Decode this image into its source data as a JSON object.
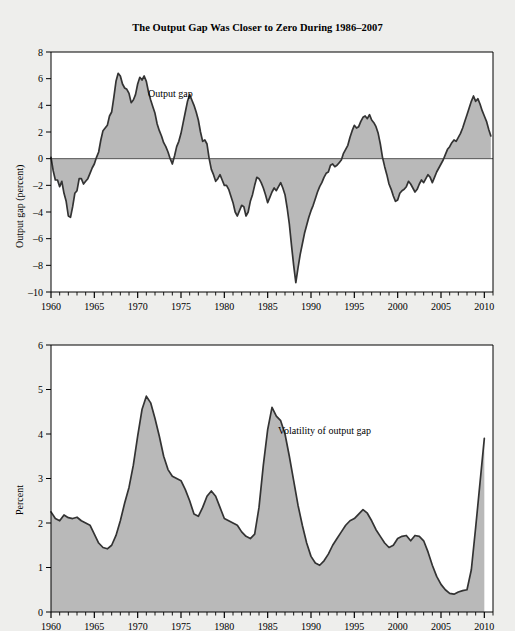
{
  "figure": {
    "title": "The Output Gap Was Closer to Zero During 1986–2007",
    "background_color": "#eeeeec",
    "plot_background_color": "#ffffff",
    "fill_color": "#b9b9b9",
    "line_color": "#333333",
    "axis_color": "#000000"
  },
  "chart_data": [
    {
      "type": "area",
      "id": "output-gap",
      "title": "The Output Gap Was Closer to Zero During 1986–2007",
      "xlabel": "",
      "ylabel": "Output gap (percent)",
      "annotation": "Output gap",
      "annotation_x": 1971.2,
      "annotation_y": 4.6,
      "xlim": [
        1960,
        2011
      ],
      "ylim": [
        -10,
        8
      ],
      "yticks": [
        -10,
        -8,
        -6,
        -4,
        -2,
        0,
        2,
        4,
        6,
        8
      ],
      "ytick_labels": [
        "–10",
        "–8",
        "–6",
        "–4",
        "–2",
        "0",
        "2",
        "4",
        "6",
        "8"
      ],
      "xticks": [
        1960,
        1965,
        1970,
        1975,
        1980,
        1985,
        1990,
        1995,
        2000,
        2005,
        2010
      ],
      "xtick_labels": [
        "1960",
        "1965",
        "1970",
        "1975",
        "1980",
        "1985",
        "1990",
        "1995",
        "2000",
        "2005",
        "2010"
      ],
      "minor_xtick_interval": 1,
      "grid": false,
      "baseline": 0,
      "fill_to": 0,
      "x": [
        1960.0,
        1960.25,
        1960.5,
        1960.75,
        1961.0,
        1961.25,
        1961.5,
        1961.75,
        1962.0,
        1962.25,
        1962.5,
        1962.75,
        1963.0,
        1963.25,
        1963.5,
        1963.75,
        1964.0,
        1964.25,
        1964.5,
        1964.75,
        1965.0,
        1965.25,
        1965.5,
        1965.75,
        1966.0,
        1966.25,
        1966.5,
        1966.75,
        1967.0,
        1967.25,
        1967.5,
        1967.75,
        1968.0,
        1968.25,
        1968.5,
        1968.75,
        1969.0,
        1969.25,
        1969.5,
        1969.75,
        1970.0,
        1970.25,
        1970.5,
        1970.75,
        1971.0,
        1971.25,
        1971.5,
        1971.75,
        1972.0,
        1972.25,
        1972.5,
        1972.75,
        1973.0,
        1973.25,
        1973.5,
        1973.75,
        1974.0,
        1974.25,
        1974.5,
        1974.75,
        1975.0,
        1975.25,
        1975.5,
        1975.75,
        1976.0,
        1976.25,
        1976.5,
        1976.75,
        1977.0,
        1977.25,
        1977.5,
        1977.75,
        1978.0,
        1978.25,
        1978.5,
        1978.75,
        1979.0,
        1979.25,
        1979.5,
        1979.75,
        1980.0,
        1980.25,
        1980.5,
        1980.75,
        1981.0,
        1981.25,
        1981.5,
        1981.75,
        1982.0,
        1982.25,
        1982.5,
        1982.75,
        1983.0,
        1983.25,
        1983.5,
        1983.75,
        1984.0,
        1984.25,
        1984.5,
        1984.75,
        1985.0,
        1985.25,
        1985.5,
        1985.75,
        1986.0,
        1986.25,
        1986.5,
        1986.75,
        1987.0,
        1987.25,
        1987.5,
        1987.75,
        1988.0,
        1988.25,
        1988.5,
        1988.75,
        1989.0,
        1989.25,
        1989.5,
        1989.75,
        1990.0,
        1990.25,
        1990.5,
        1990.75,
        1991.0,
        1991.25,
        1991.5,
        1991.75,
        1992.0,
        1992.25,
        1992.5,
        1992.75,
        1993.0,
        1993.25,
        1993.5,
        1993.75,
        1994.0,
        1994.25,
        1994.5,
        1994.75,
        1995.0,
        1995.25,
        1995.5,
        1995.75,
        1996.0,
        1996.25,
        1996.5,
        1996.75,
        1997.0,
        1997.25,
        1997.5,
        1997.75,
        1998.0,
        1998.25,
        1998.5,
        1998.75,
        1999.0,
        1999.25,
        1999.5,
        1999.75,
        2000.0,
        2000.25,
        2000.5,
        2000.75,
        2001.0,
        2001.25,
        2001.5,
        2001.75,
        2002.0,
        2002.25,
        2002.5,
        2002.75,
        2003.0,
        2003.25,
        2003.5,
        2003.75,
        2004.0,
        2004.25,
        2004.5,
        2004.75,
        2005.0,
        2005.25,
        2005.5,
        2005.75,
        2006.0,
        2006.25,
        2006.5,
        2006.75,
        2007.0,
        2007.25,
        2007.5,
        2007.75,
        2008.0,
        2008.25,
        2008.5,
        2008.75,
        2009.0,
        2009.25,
        2009.5,
        2009.75,
        2010.0,
        2010.25,
        2010.5,
        2010.75
      ],
      "y": [
        0.1,
        -0.9,
        -1.6,
        -1.6,
        -2.1,
        -1.7,
        -2.6,
        -3.2,
        -4.3,
        -4.4,
        -3.6,
        -2.6,
        -2.4,
        -1.5,
        -1.5,
        -1.9,
        -1.7,
        -1.5,
        -1.1,
        -0.7,
        -0.4,
        0.1,
        0.5,
        1.4,
        2.1,
        2.3,
        2.5,
        3.2,
        3.5,
        4.6,
        5.8,
        6.4,
        6.2,
        5.6,
        5.3,
        5.2,
        4.9,
        4.2,
        4.4,
        4.8,
        5.6,
        6.1,
        5.9,
        6.2,
        5.8,
        5.0,
        4.4,
        3.9,
        3.4,
        2.6,
        2.1,
        1.7,
        1.2,
        0.9,
        0.5,
        0.0,
        -0.4,
        0.2,
        0.9,
        1.3,
        1.9,
        2.7,
        3.5,
        4.3,
        4.8,
        4.4,
        4.0,
        3.5,
        2.9,
        2.0,
        1.3,
        1.4,
        1.1,
        0.0,
        -0.8,
        -1.2,
        -1.7,
        -1.5,
        -1.2,
        -1.6,
        -2.0,
        -2.0,
        -2.3,
        -2.8,
        -3.3,
        -4.0,
        -4.3,
        -3.9,
        -3.5,
        -3.6,
        -4.3,
        -4.0,
        -3.2,
        -2.7,
        -2.0,
        -1.4,
        -1.5,
        -1.8,
        -2.2,
        -2.7,
        -3.3,
        -2.9,
        -2.5,
        -2.2,
        -2.4,
        -2.1,
        -1.8,
        -2.2,
        -2.7,
        -3.7,
        -4.9,
        -6.5,
        -8.0,
        -9.3,
        -8.2,
        -7.2,
        -6.4,
        -5.6,
        -5.0,
        -4.4,
        -3.9,
        -3.5,
        -3.0,
        -2.5,
        -2.1,
        -1.8,
        -1.4,
        -1.1,
        -1.0,
        -0.5,
        -0.4,
        -0.6,
        -0.5,
        -0.3,
        -0.1,
        0.4,
        0.7,
        1.0,
        1.6,
        2.1,
        2.5,
        2.3,
        2.4,
        2.8,
        3.1,
        3.2,
        3.0,
        3.3,
        2.9,
        2.7,
        2.4,
        1.9,
        1.1,
        0.1,
        -0.6,
        -1.2,
        -1.9,
        -2.3,
        -2.8,
        -3.2,
        -3.1,
        -2.6,
        -2.4,
        -2.3,
        -2.1,
        -1.7,
        -1.9,
        -2.2,
        -2.5,
        -2.3,
        -1.9,
        -1.6,
        -1.8,
        -1.5,
        -1.2,
        -1.4,
        -1.8,
        -1.4,
        -1.0,
        -0.7,
        -0.4,
        -0.1,
        0.3,
        0.7,
        0.9,
        1.2,
        1.4,
        1.3,
        1.6,
        1.9,
        2.3,
        2.8,
        3.3,
        3.8,
        4.3,
        4.7,
        4.3,
        4.5,
        4.1,
        3.6,
        3.2,
        2.8,
        2.2,
        1.7,
        1.0,
        0.4,
        0.0,
        -0.3,
        -0.6,
        -1.0,
        -1.5,
        -0.9,
        -0.3,
        -0.1,
        -0.2,
        -0.1,
        0.2,
        0.4,
        0.3,
        0.0,
        0.5,
        0.9,
        0.6,
        0.3,
        0.4,
        0.2,
        -0.1,
        -0.4,
        -0.6,
        -1.1,
        -2.0,
        -3.4,
        -5.2,
        -6.9,
        -8.0,
        -8.6,
        -8.3,
        -8.0,
        -8.2,
        -8.0,
        -7.9,
        -7.7
      ]
    },
    {
      "type": "area",
      "id": "volatility-of-output-gap",
      "title": "",
      "xlabel": "",
      "ylabel": "Percent",
      "annotation": "Volatility of output gap",
      "annotation_x": 1986.2,
      "annotation_y": 4.0,
      "xlim": [
        1960,
        2011
      ],
      "ylim": [
        0,
        6
      ],
      "yticks": [
        0,
        1,
        2,
        3,
        4,
        5,
        6
      ],
      "ytick_labels": [
        "0",
        "1",
        "2",
        "3",
        "4",
        "5",
        "6"
      ],
      "xticks": [
        1960,
        1965,
        1970,
        1975,
        1980,
        1985,
        1990,
        1995,
        2000,
        2005,
        2010
      ],
      "xtick_labels": [
        "1960",
        "1965",
        "1970",
        "1975",
        "1980",
        "1985",
        "1990",
        "1995",
        "2000",
        "2005",
        "2010"
      ],
      "minor_xtick_interval": 1,
      "grid": false,
      "baseline": 0,
      "fill_to": 0,
      "x": [
        1960.0,
        1960.5,
        1961.0,
        1961.5,
        1962.0,
        1962.5,
        1963.0,
        1963.5,
        1964.0,
        1964.5,
        1965.0,
        1965.5,
        1966.0,
        1966.5,
        1967.0,
        1967.5,
        1968.0,
        1968.5,
        1969.0,
        1969.5,
        1970.0,
        1970.5,
        1971.0,
        1971.5,
        1972.0,
        1972.5,
        1973.0,
        1973.5,
        1974.0,
        1974.5,
        1975.0,
        1975.5,
        1976.0,
        1976.5,
        1977.0,
        1977.5,
        1978.0,
        1978.5,
        1979.0,
        1979.5,
        1980.0,
        1980.5,
        1981.0,
        1981.5,
        1982.0,
        1982.5,
        1983.0,
        1983.5,
        1984.0,
        1984.5,
        1985.0,
        1985.5,
        1986.0,
        1986.5,
        1987.0,
        1987.5,
        1988.0,
        1988.5,
        1989.0,
        1989.5,
        1990.0,
        1990.5,
        1991.0,
        1991.5,
        1992.0,
        1992.5,
        1993.0,
        1993.5,
        1994.0,
        1994.5,
        1995.0,
        1995.5,
        1996.0,
        1996.5,
        1997.0,
        1997.5,
        1998.0,
        1998.5,
        1999.0,
        1999.5,
        2000.0,
        2000.5,
        2001.0,
        2001.5,
        2002.0,
        2002.5,
        2003.0,
        2003.5,
        2004.0,
        2004.5,
        2005.0,
        2005.5,
        2006.0,
        2006.5,
        2007.0,
        2007.5,
        2008.0,
        2008.5,
        2009.0,
        2009.5,
        2010.0
      ],
      "y": [
        2.25,
        2.1,
        2.05,
        2.18,
        2.12,
        2.1,
        2.13,
        2.05,
        2.0,
        1.95,
        1.75,
        1.55,
        1.45,
        1.42,
        1.5,
        1.72,
        2.05,
        2.45,
        2.8,
        3.3,
        3.95,
        4.55,
        4.85,
        4.7,
        4.35,
        3.95,
        3.5,
        3.2,
        3.05,
        3.0,
        2.95,
        2.75,
        2.5,
        2.2,
        2.15,
        2.35,
        2.6,
        2.72,
        2.6,
        2.35,
        2.1,
        2.05,
        2.0,
        1.95,
        1.8,
        1.7,
        1.65,
        1.75,
        2.35,
        3.3,
        4.1,
        4.6,
        4.4,
        4.3,
        4.0,
        3.5,
        2.95,
        2.4,
        1.95,
        1.55,
        1.25,
        1.1,
        1.05,
        1.15,
        1.3,
        1.5,
        1.65,
        1.8,
        1.95,
        2.05,
        2.1,
        2.2,
        2.3,
        2.22,
        2.05,
        1.85,
        1.7,
        1.55,
        1.45,
        1.5,
        1.65,
        1.7,
        1.72,
        1.6,
        1.72,
        1.7,
        1.6,
        1.35,
        1.05,
        0.8,
        0.62,
        0.5,
        0.42,
        0.4,
        0.45,
        0.48,
        0.5,
        0.95,
        1.9,
        2.9,
        3.9
      ]
    }
  ]
}
